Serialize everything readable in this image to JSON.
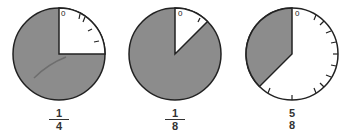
{
  "colors": {
    "shaded": "#8c8c8c",
    "outline": "#222222",
    "background": "#ffffff"
  },
  "dials": [
    {
      "center_x": 59,
      "center_y": 54,
      "radius": 46,
      "white_start_fraction": 0,
      "white_end_fraction": 0.25,
      "zero_label": "0",
      "fraction": {
        "numerator": "1",
        "denominator": "4"
      },
      "tick_count": 8
    },
    {
      "center_x": 175,
      "center_y": 54,
      "radius": 46,
      "white_start_fraction": 0,
      "white_end_fraction": 0.125,
      "zero_label": "0",
      "fraction": {
        "numerator": "1",
        "denominator": "8"
      },
      "tick_count": 8
    },
    {
      "center_x": 292,
      "center_y": 54,
      "radius": 46,
      "white_start_fraction": 0,
      "white_end_fraction": 0.625,
      "zero_label": "0",
      "fraction": {
        "numerator": "5",
        "denominator": "8"
      },
      "tick_count": 8
    }
  ]
}
